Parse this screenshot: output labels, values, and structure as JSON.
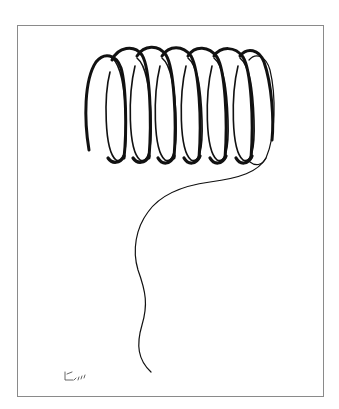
{
  "artwork": {
    "subject": "coiled spring line drawing",
    "medium": "ink",
    "colors": {
      "ink": "#111111",
      "paper": "#ffffff",
      "frame": "#8a8a8a"
    },
    "coil": {
      "loop_count": 7
    },
    "signature": {
      "visible": true
    }
  }
}
